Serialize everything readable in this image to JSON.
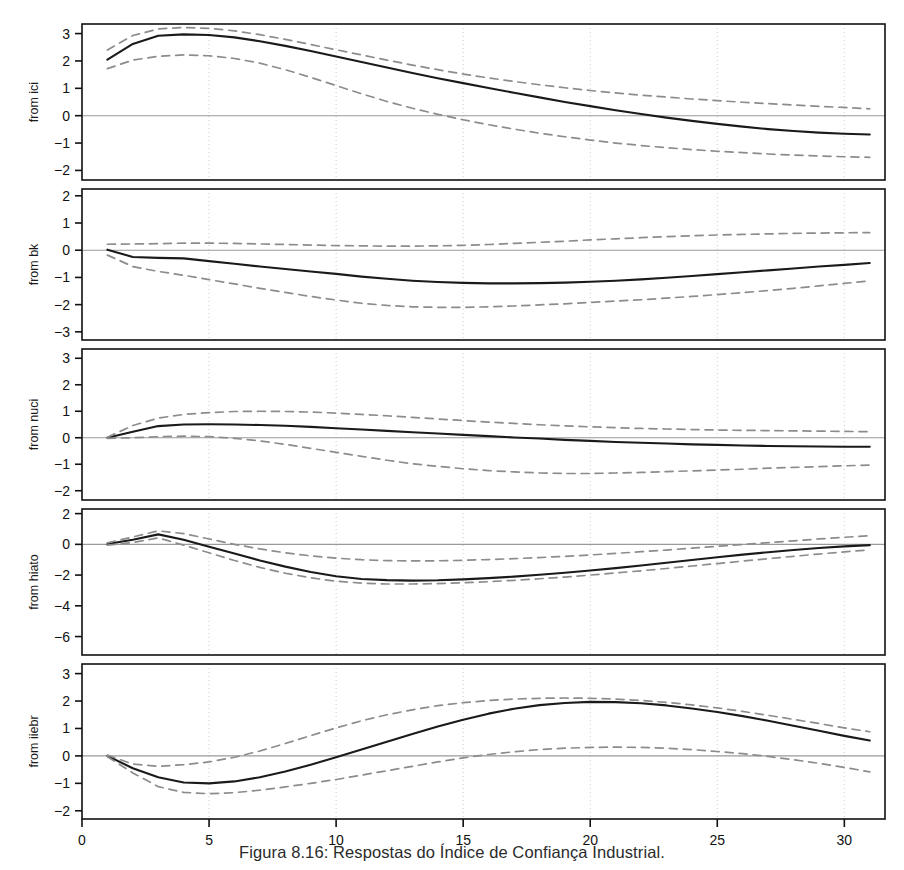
{
  "caption": "Figura 8.16: Respostas do Índice de Confiança Industrial.",
  "colors": {
    "line": "#1a1a1a",
    "band": "#8c8c8c",
    "zero_line": "#9a9a9a",
    "frame": "#111111",
    "grid": "#cccccc",
    "background": "#ffffff"
  },
  "axis": {
    "x_label": "",
    "x_ticks": [
      0,
      5,
      10,
      15,
      20,
      25,
      30
    ],
    "x_min": 0,
    "x_max": 31.6,
    "grid": "vertical dotted at x ticks"
  },
  "chart_data": {
    "type": "line",
    "title": "Figura 8.16: Respostas do Índice de Confiança Industrial.",
    "xlabel": "",
    "ylabel": "",
    "legend": [],
    "legend_position": "none",
    "grid": true,
    "xlim": [
      0,
      31.6
    ],
    "x_ticks": [
      0,
      5,
      10,
      15,
      20,
      25,
      30
    ],
    "x": [
      1,
      2,
      3,
      4,
      5,
      6,
      7,
      8,
      9,
      10,
      11,
      12,
      13,
      14,
      15,
      16,
      17,
      18,
      19,
      20,
      21,
      22,
      23,
      24,
      25,
      26,
      27,
      28,
      29,
      30,
      31
    ],
    "panels": [
      {
        "label": "from ici",
        "ylim": [
          -2.35,
          3.35
        ],
        "y_ticks": [
          3,
          2,
          1,
          0,
          -1,
          -2
        ],
        "series": [
          {
            "name": "response",
            "style": "solid",
            "values": [
              2.05,
              2.62,
              2.92,
              2.97,
              2.95,
              2.86,
              2.72,
              2.55,
              2.36,
              2.16,
              1.96,
              1.76,
              1.56,
              1.37,
              1.19,
              1.01,
              0.84,
              0.67,
              0.5,
              0.35,
              0.2,
              0.06,
              -0.07,
              -0.19,
              -0.3,
              -0.4,
              -0.49,
              -0.56,
              -0.62,
              -0.66,
              -0.69
            ]
          },
          {
            "name": "upper-band",
            "style": "dashed",
            "values": [
              2.4,
              2.93,
              3.17,
              3.22,
              3.19,
              3.1,
              2.96,
              2.79,
              2.6,
              2.41,
              2.22,
              2.03,
              1.85,
              1.68,
              1.52,
              1.38,
              1.25,
              1.13,
              1.02,
              0.92,
              0.83,
              0.75,
              0.68,
              0.61,
              0.55,
              0.49,
              0.44,
              0.39,
              0.34,
              0.3,
              0.25
            ]
          },
          {
            "name": "lower-band",
            "style": "dashed",
            "values": [
              1.72,
              2.03,
              2.17,
              2.22,
              2.19,
              2.09,
              1.92,
              1.68,
              1.4,
              1.1,
              0.8,
              0.52,
              0.27,
              0.05,
              -0.15,
              -0.33,
              -0.49,
              -0.64,
              -0.77,
              -0.89,
              -1.0,
              -1.09,
              -1.17,
              -1.24,
              -1.3,
              -1.35,
              -1.4,
              -1.44,
              -1.47,
              -1.5,
              -1.52
            ]
          }
        ]
      },
      {
        "label": "from bk",
        "ylim": [
          -3.3,
          2.25
        ],
        "y_ticks": [
          2,
          1,
          0,
          -1,
          -2,
          -3
        ],
        "series": [
          {
            "name": "response",
            "style": "solid",
            "values": [
              0.02,
              -0.25,
              -0.28,
              -0.3,
              -0.4,
              -0.5,
              -0.6,
              -0.69,
              -0.78,
              -0.87,
              -0.97,
              -1.05,
              -1.12,
              -1.17,
              -1.2,
              -1.22,
              -1.22,
              -1.21,
              -1.19,
              -1.16,
              -1.12,
              -1.07,
              -1.01,
              -0.95,
              -0.88,
              -0.81,
              -0.74,
              -0.67,
              -0.6,
              -0.54,
              -0.47
            ]
          },
          {
            "name": "upper-band",
            "style": "dashed",
            "values": [
              0.22,
              0.23,
              0.24,
              0.26,
              0.26,
              0.25,
              0.23,
              0.21,
              0.19,
              0.17,
              0.16,
              0.15,
              0.15,
              0.16,
              0.18,
              0.21,
              0.25,
              0.29,
              0.33,
              0.38,
              0.42,
              0.46,
              0.5,
              0.53,
              0.56,
              0.58,
              0.6,
              0.62,
              0.63,
              0.64,
              0.65
            ]
          },
          {
            "name": "lower-band",
            "style": "dashed",
            "values": [
              -0.18,
              -0.6,
              -0.78,
              -0.92,
              -1.08,
              -1.24,
              -1.4,
              -1.55,
              -1.7,
              -1.83,
              -1.95,
              -2.03,
              -2.08,
              -2.1,
              -2.1,
              -2.08,
              -2.05,
              -2.01,
              -1.97,
              -1.92,
              -1.87,
              -1.82,
              -1.76,
              -1.7,
              -1.63,
              -1.56,
              -1.48,
              -1.4,
              -1.31,
              -1.22,
              -1.13
            ]
          }
        ]
      },
      {
        "label": "from nuci",
        "ylim": [
          -2.35,
          3.35
        ],
        "y_ticks": [
          3,
          2,
          1,
          0,
          -1,
          -2
        ],
        "series": [
          {
            "name": "response",
            "style": "solid",
            "values": [
              0.0,
              0.23,
              0.44,
              0.5,
              0.51,
              0.5,
              0.48,
              0.45,
              0.41,
              0.36,
              0.31,
              0.26,
              0.21,
              0.16,
              0.11,
              0.06,
              0.01,
              -0.03,
              -0.08,
              -0.12,
              -0.16,
              -0.19,
              -0.22,
              -0.25,
              -0.27,
              -0.29,
              -0.31,
              -0.32,
              -0.33,
              -0.34,
              -0.34
            ]
          },
          {
            "name": "upper-band",
            "style": "dashed",
            "values": [
              0.02,
              0.46,
              0.74,
              0.88,
              0.95,
              0.99,
              1.0,
              0.99,
              0.97,
              0.93,
              0.88,
              0.83,
              0.77,
              0.71,
              0.65,
              0.59,
              0.54,
              0.49,
              0.45,
              0.41,
              0.38,
              0.35,
              0.33,
              0.31,
              0.29,
              0.28,
              0.27,
              0.26,
              0.25,
              0.24,
              0.23
            ]
          },
          {
            "name": "lower-band",
            "style": "dashed",
            "values": [
              -0.02,
              0.0,
              0.04,
              0.06,
              0.04,
              -0.02,
              -0.12,
              -0.25,
              -0.4,
              -0.55,
              -0.7,
              -0.85,
              -0.98,
              -1.08,
              -1.17,
              -1.24,
              -1.29,
              -1.33,
              -1.35,
              -1.35,
              -1.33,
              -1.31,
              -1.28,
              -1.25,
              -1.22,
              -1.19,
              -1.15,
              -1.12,
              -1.09,
              -1.06,
              -1.03
            ]
          }
        ]
      },
      {
        "label": "from hiato",
        "ylim": [
          -7.2,
          2.3
        ],
        "y_ticks": [
          2,
          0,
          -2,
          -4,
          -6
        ],
        "series": [
          {
            "name": "response",
            "style": "solid",
            "values": [
              0.02,
              0.3,
              0.65,
              0.3,
              -0.15,
              -0.6,
              -1.05,
              -1.45,
              -1.8,
              -2.08,
              -2.25,
              -2.33,
              -2.36,
              -2.34,
              -2.28,
              -2.2,
              -2.1,
              -1.98,
              -1.85,
              -1.7,
              -1.55,
              -1.38,
              -1.2,
              -1.02,
              -0.84,
              -0.67,
              -0.51,
              -0.37,
              -0.24,
              -0.13,
              -0.05
            ]
          },
          {
            "name": "upper-band",
            "style": "dashed",
            "values": [
              0.1,
              0.48,
              0.88,
              0.7,
              0.35,
              0.0,
              -0.3,
              -0.55,
              -0.75,
              -0.9,
              -1.0,
              -1.06,
              -1.08,
              -1.07,
              -1.04,
              -0.99,
              -0.93,
              -0.86,
              -0.78,
              -0.69,
              -0.59,
              -0.48,
              -0.37,
              -0.25,
              -0.13,
              -0.01,
              0.11,
              0.23,
              0.35,
              0.46,
              0.56
            ]
          },
          {
            "name": "lower-band",
            "style": "dashed",
            "values": [
              -0.05,
              0.12,
              0.42,
              -0.05,
              -0.55,
              -1.05,
              -1.5,
              -1.88,
              -2.18,
              -2.4,
              -2.52,
              -2.58,
              -2.58,
              -2.55,
              -2.5,
              -2.43,
              -2.34,
              -2.24,
              -2.13,
              -2.0,
              -1.86,
              -1.72,
              -1.57,
              -1.41,
              -1.25,
              -1.09,
              -0.93,
              -0.78,
              -0.63,
              -0.49,
              -0.36
            ]
          }
        ]
      },
      {
        "label": "from iiebr",
        "ylim": [
          -2.3,
          3.35
        ],
        "y_ticks": [
          3,
          2,
          1,
          0,
          -1,
          -2
        ],
        "series": [
          {
            "name": "response",
            "style": "solid",
            "values": [
              0.0,
              -0.45,
              -0.78,
              -0.97,
              -1.0,
              -0.93,
              -0.78,
              -0.57,
              -0.32,
              -0.05,
              0.23,
              0.52,
              0.8,
              1.07,
              1.32,
              1.54,
              1.72,
              1.85,
              1.93,
              1.97,
              1.96,
              1.92,
              1.84,
              1.73,
              1.6,
              1.45,
              1.28,
              1.1,
              0.92,
              0.73,
              0.56
            ]
          },
          {
            "name": "upper-band",
            "style": "dashed",
            "values": [
              0.03,
              -0.3,
              -0.38,
              -0.32,
              -0.22,
              -0.05,
              0.18,
              0.45,
              0.74,
              1.02,
              1.28,
              1.5,
              1.68,
              1.83,
              1.94,
              2.02,
              2.07,
              2.1,
              2.11,
              2.1,
              2.07,
              2.02,
              1.95,
              1.86,
              1.75,
              1.62,
              1.48,
              1.33,
              1.18,
              1.02,
              0.88
            ]
          },
          {
            "name": "lower-band",
            "style": "dashed",
            "values": [
              -0.03,
              -0.62,
              -1.12,
              -1.33,
              -1.38,
              -1.34,
              -1.25,
              -1.13,
              -1.0,
              -0.86,
              -0.7,
              -0.54,
              -0.38,
              -0.22,
              -0.07,
              0.05,
              0.15,
              0.23,
              0.28,
              0.31,
              0.32,
              0.31,
              0.28,
              0.23,
              0.16,
              0.08,
              -0.02,
              -0.14,
              -0.27,
              -0.42,
              -0.58
            ]
          }
        ]
      }
    ]
  }
}
